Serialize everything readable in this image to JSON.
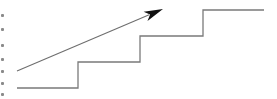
{
  "diagram": {
    "type": "staircase-with-trend-arrow",
    "colors": {
      "background": "#ffffff",
      "stair_line": "#7a7a7a",
      "arrow_line": "#6e6e6e",
      "arrow_head": "#111111",
      "edge_marks": "#8a8a8a"
    },
    "staircase": {
      "steps": 4,
      "points": [
        [
          17,
          88
        ],
        [
          78,
          88
        ],
        [
          78,
          62
        ],
        [
          140,
          62
        ],
        [
          140,
          36
        ],
        [
          203,
          36
        ],
        [
          203,
          10
        ],
        [
          264,
          10
        ]
      ]
    },
    "arrow": {
      "start": [
        17,
        71
      ],
      "end": [
        163,
        9
      ]
    },
    "edge_marks_y": [
      14,
      28,
      44,
      58,
      70,
      82,
      93
    ]
  }
}
